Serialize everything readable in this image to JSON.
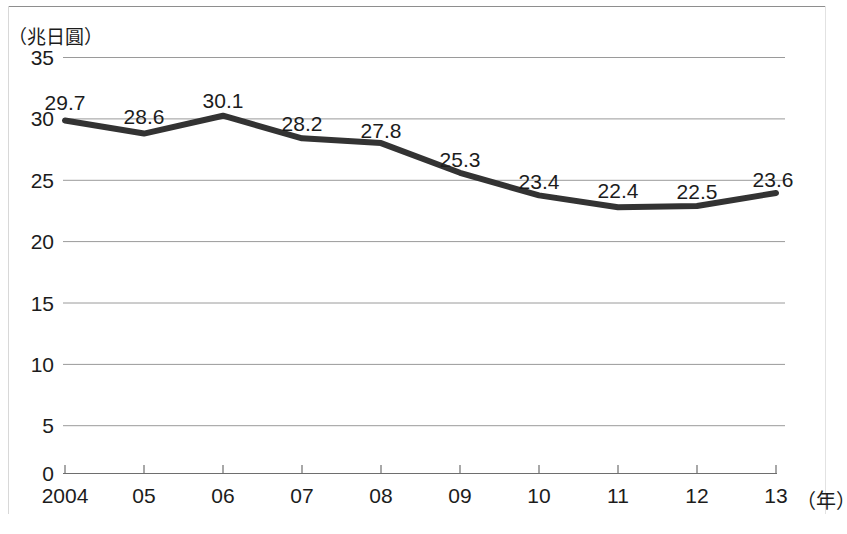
{
  "chart_data": {
    "type": "line",
    "title": "",
    "subtitle": "",
    "ylabel": "（兆日圓）",
    "xlabel": "（年）",
    "categories": [
      "2004",
      "05",
      "06",
      "07",
      "08",
      "09",
      "10",
      "11",
      "12",
      "13"
    ],
    "values": [
      29.7,
      28.6,
      30.1,
      28.2,
      27.8,
      25.3,
      23.4,
      22.4,
      22.5,
      23.6
    ],
    "data_labels": [
      "29.7",
      "28.6",
      "30.1",
      "28.2",
      "27.8",
      "25.3",
      "23.4",
      "22.4",
      "22.5",
      "23.6"
    ],
    "ylim": [
      0,
      35
    ],
    "yticks": [
      0,
      5,
      10,
      15,
      20,
      25,
      30,
      35
    ],
    "ytick_labels": [
      "0",
      "5",
      "10",
      "15",
      "20",
      "25",
      "30",
      "35"
    ],
    "grid": true,
    "legend": null,
    "series": [
      {
        "name": "",
        "values": [
          29.7,
          28.6,
          30.1,
          28.2,
          27.8,
          25.3,
          23.4,
          22.4,
          22.5,
          23.6
        ],
        "color": "#333333"
      }
    ],
    "colors": {
      "line": "#333333",
      "grid": "#9a9a9a",
      "axis": "#6e6e6e",
      "text": "#1c1c1c"
    }
  },
  "axis": {
    "y_unit": "（兆日圓）",
    "x_unit": "（年）",
    "y_ticks": [
      "35",
      "30",
      "25",
      "20",
      "15",
      "10",
      "5",
      "0"
    ],
    "x_ticks": [
      "2004",
      "05",
      "06",
      "07",
      "08",
      "09",
      "10",
      "11",
      "12",
      "13"
    ]
  },
  "labels": {
    "points": [
      "29.7",
      "28.6",
      "30.1",
      "28.2",
      "27.8",
      "25.3",
      "23.4",
      "22.4",
      "22.5",
      "23.6"
    ]
  }
}
